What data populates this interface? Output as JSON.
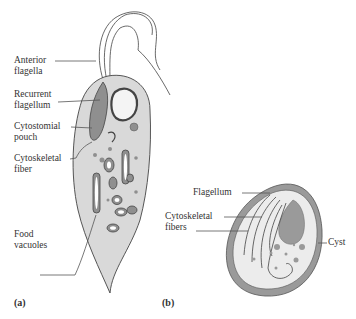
{
  "figure": {
    "panel_a": {
      "label": "(a)",
      "labels": {
        "anterior_flagella": [
          "Anterior",
          "flagella"
        ],
        "recurrent_flagellum": [
          "Recurrent",
          "flagellum"
        ],
        "cytostomial_pouch": [
          "Cytostomial",
          "pouch"
        ],
        "cytoskeletal_fiber": [
          "Cytoskeletal",
          "fiber"
        ],
        "food_vacuoles": [
          "Food",
          "vacuoles"
        ]
      }
    },
    "panel_b": {
      "label": "(b)",
      "labels": {
        "flagellum": "Flagellum",
        "cytoskeletal_fibers": [
          "Cytoskeletal",
          "fibers"
        ],
        "cyst": "Cyst"
      }
    },
    "colors": {
      "cell_fill": "#d9d9d9",
      "organelle_fill": "#8f8f8f",
      "outline": "#444444",
      "cyst_wall": "#9a9a9a",
      "cyst_inner": "#ececec"
    }
  }
}
